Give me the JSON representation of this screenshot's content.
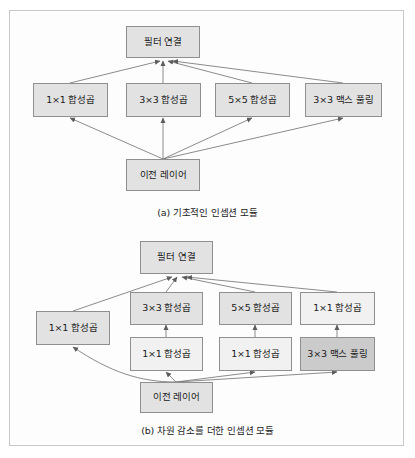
{
  "figure": {
    "kind": "two-panel-diagram",
    "background": "#ffffff",
    "frame_color": "#c9c9c9",
    "node_border_color": "#8f8f8f",
    "node_fill_light": "#f1f1f1",
    "node_fill_medium": "#e2e2e2",
    "node_fill_dark": "#cbcbcb",
    "edge_color": "#767676"
  },
  "panel_a": {
    "caption": "(a) 기초적인 인셉션 모듈",
    "nodes": {
      "concat": "필터 연결",
      "conv1x1": "1×1 합성곱",
      "conv3x3": "3×3 합성곱",
      "conv5x5": "5×5 합성곱",
      "maxpool3x3": "3×3 맥스 풀링",
      "previous": "이전 레이어"
    }
  },
  "panel_b": {
    "caption": "(b) 차원 감소를 더한 인셉션 모듈",
    "nodes": {
      "concat": "필터 연결",
      "left_conv1x1": "1×1 합성곱",
      "conv3x3": "3×3 합성곱",
      "conv5x5": "5×5 합성곱",
      "right_conv1x1": "1×1 합성곱",
      "reduce_conv1x1_a": "1×1 합성곱",
      "reduce_conv1x1_b": "1×1 합성곱",
      "maxpool3x3": "3×3 맥스 풀링",
      "previous": "이전 레이어"
    }
  }
}
